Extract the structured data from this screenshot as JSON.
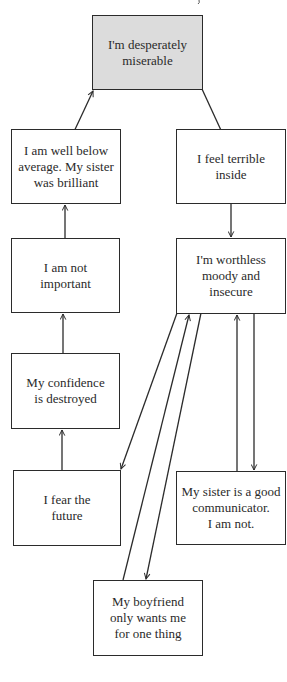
{
  "diagram": {
    "type": "flow-diagram",
    "nodes": [
      {
        "id": "miserable",
        "label": "I'm desperately miserable",
        "lines": [
          "I'm desperately",
          "miserable"
        ],
        "highlighted": true
      },
      {
        "id": "below_average",
        "label": "I am well below average. My sister was brilliant",
        "lines": [
          "I am well below",
          "average. My sister",
          "was brilliant"
        ]
      },
      {
        "id": "not_important",
        "label": "I am not important",
        "lines": [
          "I am not",
          "important"
        ]
      },
      {
        "id": "confidence",
        "label": "My confidence is destroyed",
        "lines": [
          "My confidence",
          "is destroyed"
        ]
      },
      {
        "id": "fear_future",
        "label": "I fear the future",
        "lines": [
          "I fear the",
          "future"
        ]
      },
      {
        "id": "feel_terrible",
        "label": "I feel terrible inside",
        "lines": [
          "I feel terrible",
          "inside"
        ]
      },
      {
        "id": "worthless",
        "label": "I'm worthless moody and insecure",
        "lines": [
          "I'm worthless",
          "moody and",
          "insecure"
        ]
      },
      {
        "id": "sister_communicator",
        "label": "My sister is a good communicator. I am not.",
        "lines": [
          "My sister is a good",
          "communicator.",
          "I am not."
        ]
      },
      {
        "id": "boyfriend",
        "label": "My boyfriend only wants me for one thing",
        "lines": [
          "My boyfriend",
          "only wants me",
          "for one thing"
        ]
      }
    ],
    "edges": [
      {
        "from": "fear_future",
        "to": "confidence"
      },
      {
        "from": "confidence",
        "to": "not_important"
      },
      {
        "from": "not_important",
        "to": "below_average"
      },
      {
        "from": "below_average",
        "to": "miserable"
      },
      {
        "from": "miserable",
        "to": "feel_terrible"
      },
      {
        "from": "feel_terrible",
        "to": "worthless"
      },
      {
        "from": "worthless",
        "to": "fear_future"
      },
      {
        "from": "worthless",
        "to": "boyfriend"
      },
      {
        "from": "boyfriend",
        "to": "worthless"
      },
      {
        "from": "worthless",
        "to": "sister_communicator"
      },
      {
        "from": "sister_communicator",
        "to": "worthless"
      }
    ]
  },
  "colors": {
    "highlight_fill": "#dcdcdc",
    "border": "#2b2b2b",
    "background": "#ffffff"
  }
}
